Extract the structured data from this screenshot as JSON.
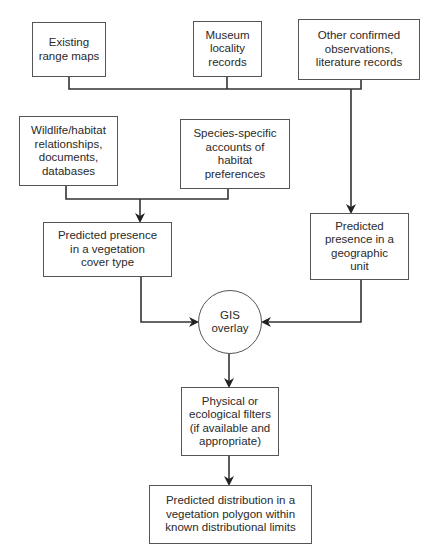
{
  "diagram": {
    "type": "flowchart",
    "nodes": {
      "range_maps": "Existing\nrange maps",
      "museum": "Museum\nlocality\nrecords",
      "other_obs": "Other confirmed\nobservations,\nliterature records",
      "wildlife": "Wildlife/habitat\nrelationships,\ndocuments,\ndatabases",
      "species": "Species-specific\naccounts of\nhabitat\npreferences",
      "veg_presence": "Predicted presence\nin a vegetation\ncover type",
      "geo_presence": "Predicted\npresence in a\ngeographic\nunit",
      "gis": "GIS\noverlay",
      "filters": "Physical or\necological filters\n(if available and\nappropriate)",
      "final": "Predicted distribution in a\nvegetation polygon within\nknown distributional limits"
    },
    "edges": [
      {
        "from": [
          "range_maps",
          "museum",
          "other_obs"
        ],
        "to": "geo_presence"
      },
      {
        "from": [
          "wildlife",
          "species"
        ],
        "to": "veg_presence"
      },
      {
        "from": "veg_presence",
        "to": "gis"
      },
      {
        "from": "geo_presence",
        "to": "gis"
      },
      {
        "from": "gis",
        "to": "filters"
      },
      {
        "from": "filters",
        "to": "final"
      }
    ],
    "colors": {
      "line": "#2a2a2a",
      "border": "#555555",
      "background": "#ffffff"
    }
  }
}
